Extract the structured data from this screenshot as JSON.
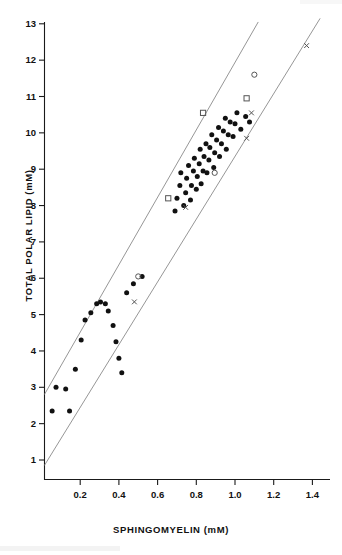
{
  "chart_data": {
    "type": "scatter",
    "title": "",
    "xlabel": "SPHINGOMYELIN  (mM)",
    "ylabel": "TOTAL POLAR LIPID  (mM)",
    "xlim": [
      0.0,
      1.5
    ],
    "ylim": [
      0.0,
      13.0
    ],
    "grid": false,
    "legend": "none",
    "xticks": [
      "0.2",
      "0.4",
      "0.6",
      "0.8",
      "1.0",
      "1.2",
      "1.4"
    ],
    "xtick_values": [
      0.2,
      0.4,
      0.6,
      0.8,
      1.0,
      1.2,
      1.4
    ],
    "yticks": [
      "1",
      "2",
      "3",
      "4",
      "5",
      "6",
      "7",
      "8",
      "9",
      "10",
      "11",
      "12",
      "13"
    ],
    "ytick_values": [
      1,
      2,
      3,
      4,
      5,
      6,
      7,
      8,
      9,
      10,
      11,
      12,
      13
    ],
    "annotations": [
      {
        "name": "upper-confidence-line",
        "x0": 0.015,
        "y0": 2.8,
        "x1": 1.12,
        "y1": 13.05
      },
      {
        "name": "lower-confidence-line",
        "x0": 0.015,
        "y0": 0.85,
        "x1": 1.44,
        "y1": 13.15
      }
    ],
    "series": [
      {
        "name": "filled-circle",
        "marker": "filled-circle",
        "color": "#111111",
        "points": [
          [
            0.055,
            2.35
          ],
          [
            0.075,
            3.0
          ],
          [
            0.125,
            2.95
          ],
          [
            0.145,
            2.35
          ],
          [
            0.175,
            3.5
          ],
          [
            0.205,
            4.3
          ],
          [
            0.225,
            4.85
          ],
          [
            0.255,
            5.05
          ],
          [
            0.285,
            5.3
          ],
          [
            0.305,
            5.35
          ],
          [
            0.33,
            5.3
          ],
          [
            0.345,
            5.1
          ],
          [
            0.37,
            4.7
          ],
          [
            0.385,
            4.25
          ],
          [
            0.4,
            3.8
          ],
          [
            0.415,
            3.4
          ],
          [
            0.44,
            5.6
          ],
          [
            0.475,
            5.85
          ],
          [
            0.52,
            6.05
          ],
          [
            0.69,
            7.85
          ],
          [
            0.7,
            8.2
          ],
          [
            0.715,
            8.55
          ],
          [
            0.72,
            8.9
          ],
          [
            0.735,
            8.0
          ],
          [
            0.745,
            8.35
          ],
          [
            0.75,
            8.75
          ],
          [
            0.76,
            9.1
          ],
          [
            0.77,
            8.15
          ],
          [
            0.775,
            8.55
          ],
          [
            0.785,
            8.95
          ],
          [
            0.79,
            9.3
          ],
          [
            0.8,
            8.45
          ],
          [
            0.805,
            8.8
          ],
          [
            0.815,
            9.15
          ],
          [
            0.82,
            9.55
          ],
          [
            0.825,
            8.6
          ],
          [
            0.835,
            8.95
          ],
          [
            0.84,
            9.35
          ],
          [
            0.85,
            9.7
          ],
          [
            0.855,
            8.9
          ],
          [
            0.865,
            9.25
          ],
          [
            0.87,
            9.6
          ],
          [
            0.88,
            9.95
          ],
          [
            0.89,
            9.05
          ],
          [
            0.895,
            9.45
          ],
          [
            0.905,
            9.8
          ],
          [
            0.915,
            10.15
          ],
          [
            0.92,
            9.35
          ],
          [
            0.93,
            9.7
          ],
          [
            0.94,
            10.05
          ],
          [
            0.95,
            10.4
          ],
          [
            0.955,
            9.55
          ],
          [
            0.965,
            9.95
          ],
          [
            0.975,
            10.3
          ],
          [
            0.99,
            9.9
          ],
          [
            1.0,
            10.25
          ],
          [
            1.01,
            10.55
          ],
          [
            1.03,
            10.1
          ],
          [
            1.055,
            10.45
          ],
          [
            1.075,
            10.3
          ]
        ]
      },
      {
        "name": "open-circle",
        "marker": "open-circle",
        "color": "#555555",
        "points": [
          [
            0.5,
            6.05
          ],
          [
            0.895,
            8.9
          ],
          [
            1.1,
            11.6
          ]
        ]
      },
      {
        "name": "open-square",
        "marker": "open-square",
        "color": "#555555",
        "points": [
          [
            0.655,
            8.2
          ],
          [
            0.835,
            10.55
          ],
          [
            1.06,
            10.95
          ]
        ]
      },
      {
        "name": "cross",
        "marker": "cross",
        "color": "#555555",
        "points": [
          [
            0.48,
            5.35
          ],
          [
            0.745,
            7.95
          ],
          [
            1.06,
            9.85
          ],
          [
            1.085,
            10.55
          ],
          [
            1.37,
            12.4
          ]
        ]
      }
    ]
  },
  "axes": {
    "x_title": "SPHINGOMYELIN  (mM)",
    "y_title": "TOTAL POLAR LIPID  (mM)"
  }
}
